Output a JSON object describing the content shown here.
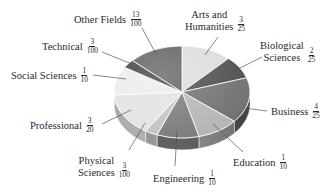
{
  "chart_data": {
    "type": "pie",
    "style": "3d-tilted",
    "title": "",
    "start_angle": "12 o'clock",
    "direction": "clockwise",
    "slices": [
      {
        "label": "Arts and Humanities",
        "fraction": "3/25",
        "num": "3",
        "den": "25",
        "value": 0.12,
        "color": "#dcdcdc"
      },
      {
        "label": "Biological Sciences",
        "fraction": "2/25",
        "num": "2",
        "den": "25",
        "value": 0.08,
        "color": "#4a4a4a"
      },
      {
        "label": "Business",
        "fraction": "4/25",
        "num": "4",
        "den": "25",
        "value": 0.16,
        "color": "#6e6e6e"
      },
      {
        "label": "Education",
        "fraction": "1/10",
        "num": "1",
        "den": "10",
        "value": 0.1,
        "color": "#b4b4b4"
      },
      {
        "label": "Engineering",
        "fraction": "1/10",
        "num": "1",
        "den": "10",
        "value": 0.1,
        "color": "#7a7a7a"
      },
      {
        "label": "Physical Sciences",
        "fraction": "3/100",
        "num": "3",
        "den": "100",
        "value": 0.03,
        "color": "#c2c2c2"
      },
      {
        "label": "Professional",
        "fraction": "3/20",
        "num": "3",
        "den": "20",
        "value": 0.15,
        "color": "#e2e2e2"
      },
      {
        "label": "Social Sciences",
        "fraction": "1/10",
        "num": "1",
        "den": "10",
        "value": 0.1,
        "color": "#ececec"
      },
      {
        "label": "Technical",
        "fraction": "3/100",
        "num": "3",
        "den": "100",
        "value": 0.03,
        "color": "#3c3c3c"
      },
      {
        "label": "Other Fields",
        "fraction": "13/100",
        "num": "13",
        "den": "100",
        "value": 0.13,
        "color": "#5c5c5c"
      }
    ]
  },
  "labels": {
    "arts": {
      "line1": "Arts and",
      "line2": "Humanities",
      "num": "3",
      "den": "25"
    },
    "bio": {
      "line1": "Biological",
      "line2": "Sciences",
      "num": "2",
      "den": "25"
    },
    "business": {
      "text": "Business",
      "num": "4",
      "den": "25"
    },
    "education": {
      "text": "Education",
      "num": "1",
      "den": "10"
    },
    "engineering": {
      "text": "Engineering",
      "num": "1",
      "den": "10"
    },
    "physical": {
      "line1": "Physical",
      "line2": "Sciences",
      "num": "3",
      "den": "100"
    },
    "professional": {
      "text": "Professional",
      "num": "3",
      "den": "20"
    },
    "social": {
      "text": "Social Sciences",
      "num": "1",
      "den": "10"
    },
    "technical": {
      "text": "Technical",
      "num": "3",
      "den": "100"
    },
    "other": {
      "text": "Other Fields",
      "num": "13",
      "den": "100"
    }
  }
}
